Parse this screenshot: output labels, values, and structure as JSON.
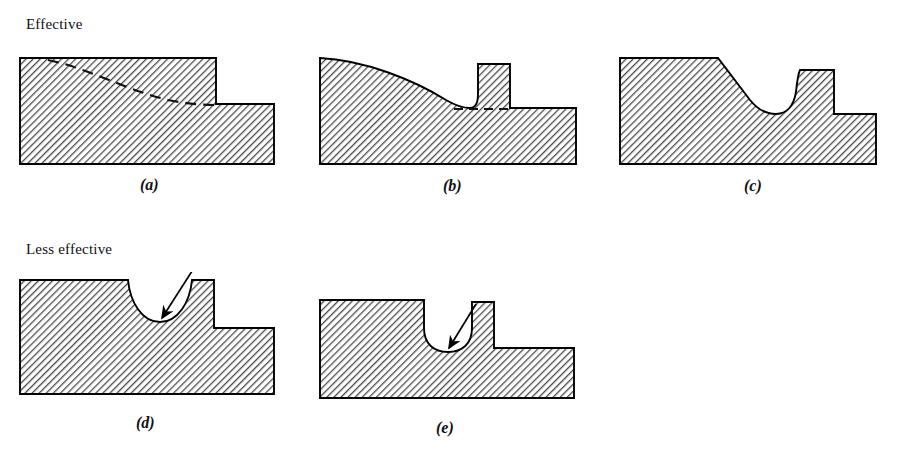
{
  "figure": {
    "title_effective": "Effective",
    "title_less_effective": "Less effective",
    "style": {
      "outline_color": "#000000",
      "hatch_color": "#4a4a4a",
      "background_color": "#ffffff",
      "dashed_guide_color": "#1a1a1a",
      "arrow_color": "#000000"
    },
    "rows": [
      {
        "label": "Effective",
        "panels": [
          "a",
          "b",
          "c"
        ]
      },
      {
        "label": "Less effective",
        "panels": [
          "d",
          "e"
        ]
      }
    ],
    "panels": [
      {
        "id": "a",
        "caption": "(a)",
        "description": "Stepped shaft shoulder with sharp square step; dashed line shows large-radius taper blend",
        "has_dashed_guide": true,
        "has_arrow": false,
        "groove_type": "none",
        "step_style": "sharp-square-step"
      },
      {
        "id": "b",
        "caption": "(b)",
        "description": "Long gradual concave taper sweeping into a generous fillet at the raised shoulder",
        "has_dashed_guide": true,
        "has_arrow": false,
        "groove_type": "tapered-relief",
        "step_style": "swept-taper-with-fillet"
      },
      {
        "id": "c",
        "caption": "(c)",
        "description": "Straight chamfer ramp blending into a wide radius valley then rising to the shoulder",
        "has_dashed_guide": false,
        "has_arrow": false,
        "groove_type": "wide-radius-relief",
        "step_style": "chamfer-plus-radius"
      },
      {
        "id": "d",
        "caption": "(d)",
        "description": "Wide shallow semicircular groove at the shoulder; arrow marks the stress riser at groove root",
        "has_dashed_guide": false,
        "has_arrow": true,
        "groove_type": "semicircular-groove",
        "step_style": "square-step-with-groove"
      },
      {
        "id": "e",
        "caption": "(e)",
        "description": "Narrow deep U-shaped groove at the shoulder; arrow marks the stress riser at groove root",
        "has_dashed_guide": false,
        "has_arrow": true,
        "groove_type": "narrow-u-groove",
        "step_style": "square-step-with-narrow-groove"
      }
    ]
  }
}
